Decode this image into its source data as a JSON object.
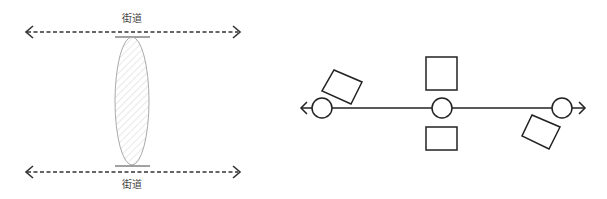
{
  "left_diagram": {
    "top_street_label": "街道",
    "bottom_street_label": "街道",
    "top_street": {
      "y": 32,
      "x1": 25,
      "x2": 240
    },
    "bottom_street": {
      "y": 172,
      "x1": 25,
      "x2": 240
    },
    "ellipse": {
      "cx": 132,
      "cy": 101,
      "rx": 17,
      "ry": 64
    },
    "top_bar": {
      "x1": 115,
      "x2": 150,
      "y": 37
    },
    "bottom_bar": {
      "x1": 115,
      "x2": 150,
      "y": 166
    },
    "colors": {
      "line": "#333333",
      "ellipse": "#aaaaaa",
      "hatch": "#d8d8d8"
    }
  },
  "right_diagram": {
    "axis": {
      "y": 108,
      "x1": 300,
      "x2": 585
    },
    "nodes": [
      {
        "cx": 322,
        "cy": 108,
        "r": 10
      },
      {
        "cx": 442,
        "cy": 108,
        "r": 10
      },
      {
        "cx": 562,
        "cy": 108,
        "r": 10
      }
    ],
    "squares": [
      {
        "name": "middle-top-square",
        "x": 426,
        "y": 57,
        "w": 31,
        "h": 33
      },
      {
        "name": "middle-bottom-square",
        "x": 426,
        "y": 127,
        "w": 31,
        "h": 23
      }
    ],
    "rotated_rects": [
      {
        "name": "upper-left-tilted-rect",
        "points": "334,70 362,82 351,104 322,91"
      },
      {
        "name": "lower-right-tilted-rect",
        "points": "532,115 560,127 549,149 522,136"
      }
    ],
    "colors": {
      "line": "#222222"
    }
  }
}
